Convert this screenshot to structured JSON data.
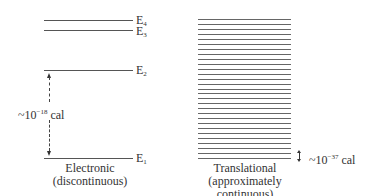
{
  "diagram": {
    "type": "energy-level-comparison",
    "electronic": {
      "levels": [
        {
          "id": "E4",
          "base": "E",
          "sub": "4",
          "y": 20
        },
        {
          "id": "E3",
          "base": "E",
          "sub": "3",
          "y": 30
        },
        {
          "id": "E2",
          "base": "E",
          "sub": "2",
          "y": 70
        },
        {
          "id": "E1",
          "base": "E",
          "sub": "1",
          "y": 158
        }
      ],
      "gap_label": {
        "prefix": "~10",
        "exponent": "−18",
        "unit": " cal"
      },
      "caption_line1": "Electronic",
      "caption_line2": "(discontinuous)"
    },
    "translational": {
      "line_count": 29,
      "top_y": 19,
      "bottom_y": 158,
      "gap_label": {
        "prefix": "~10",
        "exponent": "−37",
        "unit": " cal"
      },
      "caption_line1": "Translational",
      "caption_line2": "(approximately continuous)"
    }
  }
}
